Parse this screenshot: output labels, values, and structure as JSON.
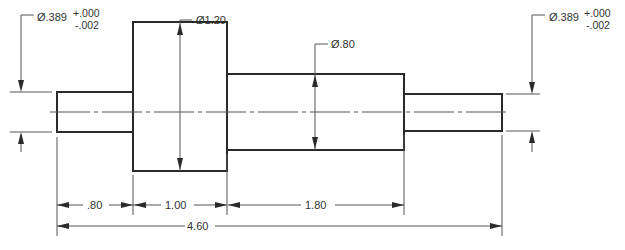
{
  "drawing": {
    "title": "Stepped shaft dimensioned drawing",
    "line_color": "#2a2a2a",
    "diameters": {
      "left_shaft": {
        "value": "Ø.389",
        "tol_upper": "+.000",
        "tol_lower": "-.002"
      },
      "large_cylinder": {
        "value": "Ø1.20"
      },
      "middle_cylinder": {
        "value": "Ø.80"
      },
      "right_shaft": {
        "value": "Ø.389",
        "tol_upper": "+.000",
        "tol_lower": "-.002"
      }
    },
    "lengths": {
      "left_shaft": ".80",
      "large_cylinder": "1.00",
      "middle_cylinder": "1.80",
      "overall": "4.60"
    }
  }
}
